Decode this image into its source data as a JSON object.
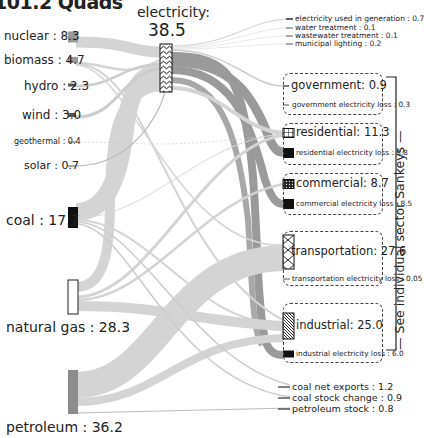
{
  "title": "101.2 Quads",
  "sources": [
    {
      "id": "nuclear",
      "label": "nuclear : 8.3",
      "value": 8.3,
      "y": 37,
      "h": 11,
      "fill": "#999999",
      "fs": 12
    },
    {
      "id": "biomass",
      "label": "biomass : 4.7",
      "value": 4.7,
      "y": 60,
      "h": 6,
      "fill": "#999999",
      "fs": 12
    },
    {
      "id": "hydro",
      "label": "hydro : 2.3",
      "value": 2.3,
      "y": 85,
      "h": 3,
      "fill": "#555555",
      "fs": 12
    },
    {
      "id": "wind",
      "label": "wind : 3.0",
      "value": 3.0,
      "y": 115,
      "h": 4,
      "fill": "#555555",
      "fs": 12
    },
    {
      "id": "geothermal",
      "label": "geothermal : 0.4",
      "value": 0.4,
      "y": 142,
      "h": 1,
      "fill": "#999999",
      "fs": 8
    },
    {
      "id": "solar",
      "label": "solar : 0.7",
      "value": 0.7,
      "y": 166,
      "h": 1.5,
      "fill": "#888888",
      "fs": 11
    },
    {
      "id": "coal",
      "label": "coal : 17.7",
      "value": 17.7,
      "y": 207,
      "h": 21,
      "fill": "#111111",
      "fs": 14
    },
    {
      "id": "natural_gas",
      "label": "natural gas : 28.3",
      "value": 28.3,
      "y": 280,
      "h": 34,
      "fill": "#ffffff",
      "fs": 14
    },
    {
      "id": "petroleum",
      "label": "petroleum : 36.2",
      "value": 36.2,
      "y": 370,
      "h": 44,
      "fill": "#8c8c8c",
      "fs": 14
    }
  ],
  "source_labels_pos": {
    "nuclear": [
      4,
      30
    ],
    "biomass": [
      4,
      54
    ],
    "hydro": [
      24,
      80
    ],
    "wind": [
      22,
      109
    ],
    "geothermal": [
      14,
      138
    ],
    "solar": [
      24,
      160
    ],
    "coal": [
      6,
      213
    ],
    "natural_gas": [
      6,
      320
    ],
    "petroleum": [
      6,
      420
    ]
  },
  "electricity": {
    "label": "electricity:",
    "value": "38.5",
    "x": 160,
    "y": 44,
    "w": 12,
    "h": 48
  },
  "outputs_small": [
    {
      "label": "electricity used in generation : 0.7",
      "y": 19
    },
    {
      "label": "water treatment : 0.1",
      "y": 28
    },
    {
      "label": "wastewater treatment : 0.1",
      "y": 36
    },
    {
      "label": "municipal lighting : 0.2",
      "y": 44
    }
  ],
  "sectors": [
    {
      "id": "government",
      "label": "government: 0.9",
      "loss_label": "government electricity loss : 0.3",
      "box": [
        283,
        73,
        100,
        42
      ],
      "main_y": 86,
      "loss_y": 105,
      "pattern": "line",
      "fs": 11.5
    },
    {
      "id": "residential",
      "label": "residential: 11.3",
      "loss_label": "residential electricity loss : 8.8",
      "box": [
        283,
        123,
        100,
        42
      ],
      "main_y": 133,
      "loss_y": 153,
      "pattern": "grid",
      "fs": 11.5
    },
    {
      "id": "commercial",
      "label": "commercial: 8.7",
      "loss_label": "commercial electricity loss : 8.5",
      "box": [
        283,
        173,
        100,
        42
      ],
      "main_y": 184,
      "loss_y": 204,
      "pattern": "dots",
      "fs": 11.5
    },
    {
      "id": "transportation",
      "label": "transportation: 27.6",
      "loss_label": "transportation electricity loss : 0.05",
      "box": [
        283,
        231,
        100,
        55
      ],
      "main_y": 252,
      "loss_y": 279,
      "pattern": "cross",
      "fs": 11.5
    },
    {
      "id": "industrial",
      "label": "industrial: 25.0",
      "loss_label": "industrial electricity loss : 6.0",
      "box": [
        283,
        303,
        100,
        60
      ],
      "main_y": 326,
      "loss_y": 354,
      "pattern": "diag",
      "fs": 11.5
    }
  ],
  "bottom_outputs": [
    {
      "label": "coal net exports : 1.2",
      "y": 387
    },
    {
      "label": "coal stock change : 0.9",
      "y": 398
    },
    {
      "label": "petroleum stock : 0.8",
      "y": 409
    }
  ],
  "side_note": "See individual sector Sankeys",
  "colors": {
    "flow": "#d4d4d4",
    "flow_dark": "#9a9a9a",
    "text": "#222222",
    "box_border": "#444444"
  }
}
